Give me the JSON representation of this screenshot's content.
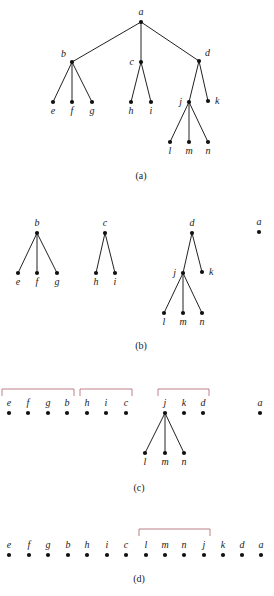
{
  "figure": {
    "panels": [
      {
        "id": "a",
        "caption": "(a)",
        "caption_pos": [
          141,
          179
        ],
        "nodes": [
          {
            "id": "a",
            "label": "a",
            "x": 141,
            "y": 22,
            "label_pos": "above"
          },
          {
            "id": "b",
            "label": "b",
            "x": 72,
            "y": 62,
            "label_pos": "upper-left"
          },
          {
            "id": "c",
            "label": "c",
            "x": 141,
            "y": 62,
            "label_pos": "left"
          },
          {
            "id": "d",
            "label": "d",
            "x": 199,
            "y": 61,
            "label_pos": "upper-right"
          },
          {
            "id": "e",
            "label": "e",
            "x": 53,
            "y": 102,
            "label_pos": "below"
          },
          {
            "id": "f",
            "label": "f",
            "x": 72,
            "y": 102,
            "label_pos": "below"
          },
          {
            "id": "g",
            "label": "g",
            "x": 92,
            "y": 102,
            "label_pos": "below"
          },
          {
            "id": "h",
            "label": "h",
            "x": 131,
            "y": 102,
            "label_pos": "below"
          },
          {
            "id": "i",
            "label": "i",
            "x": 151,
            "y": 102,
            "label_pos": "below"
          },
          {
            "id": "j",
            "label": "j",
            "x": 189,
            "y": 102,
            "label_pos": "left"
          },
          {
            "id": "k",
            "label": "k",
            "x": 208,
            "y": 101,
            "label_pos": "right"
          },
          {
            "id": "l",
            "label": "l",
            "x": 170,
            "y": 142,
            "label_pos": "below"
          },
          {
            "id": "m",
            "label": "m",
            "x": 189,
            "y": 142,
            "label_pos": "below"
          },
          {
            "id": "n",
            "label": "n",
            "x": 208,
            "y": 142,
            "label_pos": "below"
          }
        ],
        "edges": [
          [
            "a",
            "b"
          ],
          [
            "a",
            "c"
          ],
          [
            "a",
            "d"
          ],
          [
            "b",
            "e"
          ],
          [
            "b",
            "f"
          ],
          [
            "b",
            "g"
          ],
          [
            "c",
            "h"
          ],
          [
            "c",
            "i"
          ],
          [
            "d",
            "j"
          ],
          [
            "d",
            "k"
          ],
          [
            "j",
            "l"
          ],
          [
            "j",
            "m"
          ],
          [
            "j",
            "n"
          ]
        ],
        "brackets": []
      },
      {
        "id": "b",
        "caption": "(b)",
        "caption_pos": [
          141,
          349
        ],
        "nodes": [
          {
            "id": "b",
            "label": "b",
            "x": 37,
            "y": 233,
            "label_pos": "above"
          },
          {
            "id": "c",
            "label": "c",
            "x": 105,
            "y": 233,
            "label_pos": "above"
          },
          {
            "id": "d",
            "label": "d",
            "x": 192,
            "y": 233,
            "label_pos": "above"
          },
          {
            "id": "a",
            "label": "a",
            "x": 259,
            "y": 232,
            "label_pos": "above"
          },
          {
            "id": "e",
            "label": "e",
            "x": 18,
            "y": 273,
            "label_pos": "below"
          },
          {
            "id": "f",
            "label": "f",
            "x": 37,
            "y": 273,
            "label_pos": "below"
          },
          {
            "id": "g",
            "label": "g",
            "x": 57,
            "y": 273,
            "label_pos": "below"
          },
          {
            "id": "h",
            "label": "h",
            "x": 96,
            "y": 273,
            "label_pos": "below"
          },
          {
            "id": "i",
            "label": "i",
            "x": 115,
            "y": 273,
            "label_pos": "below"
          },
          {
            "id": "j",
            "label": "j",
            "x": 183,
            "y": 273,
            "label_pos": "left"
          },
          {
            "id": "k",
            "label": "k",
            "x": 202,
            "y": 272,
            "label_pos": "right"
          },
          {
            "id": "l",
            "label": "l",
            "x": 164,
            "y": 313,
            "label_pos": "below"
          },
          {
            "id": "m",
            "label": "m",
            "x": 183,
            "y": 313,
            "label_pos": "below"
          },
          {
            "id": "n",
            "label": "n",
            "x": 202,
            "y": 313,
            "label_pos": "below"
          }
        ],
        "edges": [
          [
            "b",
            "e"
          ],
          [
            "b",
            "f"
          ],
          [
            "b",
            "g"
          ],
          [
            "c",
            "h"
          ],
          [
            "c",
            "i"
          ],
          [
            "d",
            "j"
          ],
          [
            "d",
            "k"
          ],
          [
            "j",
            "l"
          ],
          [
            "j",
            "m"
          ],
          [
            "j",
            "n"
          ]
        ],
        "brackets": []
      },
      {
        "id": "c",
        "caption": "(c)",
        "caption_pos": [
          139,
          491
        ],
        "nodes": [
          {
            "id": "e",
            "label": "e",
            "x": 9,
            "y": 413,
            "label_pos": "above"
          },
          {
            "id": "f",
            "label": "f",
            "x": 28,
            "y": 413,
            "label_pos": "above"
          },
          {
            "id": "g",
            "label": "g",
            "x": 48,
            "y": 413,
            "label_pos": "above"
          },
          {
            "id": "b",
            "label": "b",
            "x": 67,
            "y": 413,
            "label_pos": "above"
          },
          {
            "id": "h",
            "label": "h",
            "x": 87,
            "y": 413,
            "label_pos": "above"
          },
          {
            "id": "i",
            "label": "i",
            "x": 106,
            "y": 413,
            "label_pos": "above"
          },
          {
            "id": "c",
            "label": "c",
            "x": 126,
            "y": 413,
            "label_pos": "above"
          },
          {
            "id": "j",
            "label": "j",
            "x": 165,
            "y": 413,
            "label_pos": "above"
          },
          {
            "id": "k",
            "label": "k",
            "x": 184,
            "y": 413,
            "label_pos": "above"
          },
          {
            "id": "d",
            "label": "d",
            "x": 203,
            "y": 413,
            "label_pos": "above"
          },
          {
            "id": "a",
            "label": "a",
            "x": 260,
            "y": 413,
            "label_pos": "above"
          },
          {
            "id": "l",
            "label": "l",
            "x": 145,
            "y": 453,
            "label_pos": "below"
          },
          {
            "id": "m",
            "label": "m",
            "x": 165,
            "y": 453,
            "label_pos": "below"
          },
          {
            "id": "n",
            "label": "n",
            "x": 184,
            "y": 453,
            "label_pos": "below"
          }
        ],
        "edges": [
          [
            "j",
            "l"
          ],
          [
            "j",
            "m"
          ],
          [
            "j",
            "n"
          ]
        ],
        "brackets": [
          {
            "x1": 2,
            "x2": 74,
            "y": 389,
            "drop": 7
          },
          {
            "x1": 80,
            "x2": 132,
            "y": 389,
            "drop": 7
          },
          {
            "x1": 158,
            "x2": 209,
            "y": 389,
            "drop": 7
          }
        ]
      },
      {
        "id": "d",
        "caption": "(d)",
        "caption_pos": [
          139,
          582
        ],
        "nodes": [
          {
            "id": "e",
            "label": "e",
            "x": 9,
            "y": 555,
            "label_pos": "above"
          },
          {
            "id": "f",
            "label": "f",
            "x": 29,
            "y": 555,
            "label_pos": "above"
          },
          {
            "id": "g",
            "label": "g",
            "x": 48,
            "y": 555,
            "label_pos": "above"
          },
          {
            "id": "b",
            "label": "b",
            "x": 68,
            "y": 555,
            "label_pos": "above"
          },
          {
            "id": "h",
            "label": "h",
            "x": 87,
            "y": 555,
            "label_pos": "above"
          },
          {
            "id": "i",
            "label": "i",
            "x": 107,
            "y": 555,
            "label_pos": "above"
          },
          {
            "id": "c",
            "label": "c",
            "x": 126,
            "y": 555,
            "label_pos": "above"
          },
          {
            "id": "l",
            "label": "l",
            "x": 146,
            "y": 555,
            "label_pos": "above"
          },
          {
            "id": "m",
            "label": "m",
            "x": 165,
            "y": 555,
            "label_pos": "above"
          },
          {
            "id": "n",
            "label": "n",
            "x": 184,
            "y": 555,
            "label_pos": "above"
          },
          {
            "id": "j",
            "label": "j",
            "x": 204,
            "y": 555,
            "label_pos": "above"
          },
          {
            "id": "k",
            "label": "k",
            "x": 223,
            "y": 555,
            "label_pos": "above"
          },
          {
            "id": "d",
            "label": "d",
            "x": 242,
            "y": 555,
            "label_pos": "above"
          },
          {
            "id": "a",
            "label": "a",
            "x": 261,
            "y": 555,
            "label_pos": "above"
          }
        ],
        "edges": [],
        "brackets": [
          {
            "x1": 139,
            "x2": 210,
            "y": 529,
            "drop": 7
          }
        ]
      }
    ]
  },
  "colors": {
    "edge": "#222222",
    "node": "#111111",
    "bracket": "#b5737a",
    "text": "#1a1a1a",
    "background": "#ffffff"
  }
}
